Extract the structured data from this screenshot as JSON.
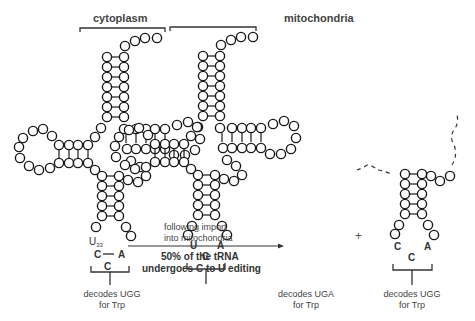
{
  "titles": {
    "left": "cytoplasm",
    "middle": "mitochondria"
  },
  "anticodons": {
    "cytoplasm": {
      "pos33": "U",
      "pos33_sub": "33",
      "n34": "C",
      "n35": "C",
      "n36": "A"
    },
    "mito_edited": {
      "n34": "U",
      "n35": "C",
      "n36": "A"
    },
    "mito_unedited": {
      "n34": "C",
      "n35": "C",
      "n36": "A"
    }
  },
  "arrow": {
    "line1": "following import",
    "line2": "into mitochondria",
    "note1": "50% of the tRNA",
    "note2": "undergoes C to U editing"
  },
  "plus": "+",
  "decodes": {
    "left": {
      "line1": "decodes UGG",
      "line2": "for Trp"
    },
    "middle": {
      "line1": "decodes UGA",
      "line2": "for Trp"
    },
    "right": {
      "line1": "decodes UGG",
      "line2": "for Trp"
    }
  },
  "colors": {
    "stroke": "#1a1a1a",
    "text": "#333333",
    "u33": "#888888"
  }
}
